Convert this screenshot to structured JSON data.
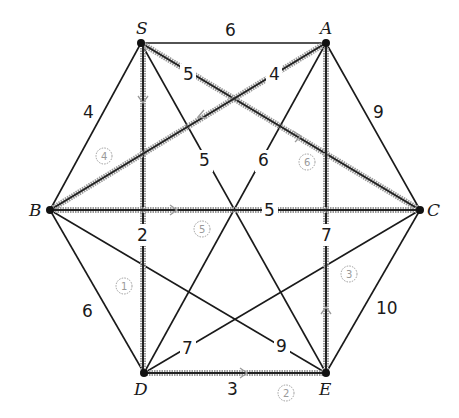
{
  "diagram": {
    "type": "weighted-graph-minimum-spanning-tree",
    "nodes": [
      {
        "id": "S",
        "label": "S",
        "x": 141,
        "y": 43
      },
      {
        "id": "A",
        "label": "A",
        "x": 326,
        "y": 43
      },
      {
        "id": "B",
        "label": "B",
        "x": 50,
        "y": 210
      },
      {
        "id": "C",
        "label": "C",
        "x": 420,
        "y": 210
      },
      {
        "id": "D",
        "label": "D",
        "x": 144,
        "y": 373
      },
      {
        "id": "E",
        "label": "E",
        "x": 326,
        "y": 373
      }
    ],
    "edges": [
      {
        "from": "S",
        "to": "A",
        "weight": "6",
        "highlighted": false
      },
      {
        "from": "S",
        "to": "B",
        "weight": "4",
        "highlighted": false
      },
      {
        "from": "S",
        "to": "C",
        "weight": "5",
        "highlighted": true,
        "order": "6",
        "direction": "S→C"
      },
      {
        "from": "S",
        "to": "D",
        "weight": "2",
        "highlighted": true,
        "order": "1",
        "direction": "S→D"
      },
      {
        "from": "S",
        "to": "E",
        "weight": "5",
        "highlighted": false
      },
      {
        "from": "A",
        "to": "B",
        "weight": "4",
        "highlighted": true,
        "order": "4",
        "direction": "A→B"
      },
      {
        "from": "A",
        "to": "C",
        "weight": "9",
        "highlighted": false
      },
      {
        "from": "A",
        "to": "D",
        "weight": "6",
        "highlighted": false
      },
      {
        "from": "A",
        "to": "E",
        "weight": "7",
        "highlighted": true,
        "order": "3",
        "direction": "E→A"
      },
      {
        "from": "B",
        "to": "C",
        "weight": "5",
        "highlighted": true,
        "order": "5",
        "direction": "B→C"
      },
      {
        "from": "B",
        "to": "D",
        "weight": "6",
        "highlighted": false
      },
      {
        "from": "B",
        "to": "E",
        "weight": "9",
        "highlighted": false
      },
      {
        "from": "C",
        "to": "D",
        "weight": "7",
        "highlighted": false
      },
      {
        "from": "C",
        "to": "E",
        "weight": "10",
        "highlighted": false
      },
      {
        "from": "D",
        "to": "E",
        "weight": "3",
        "highlighted": true,
        "order": "2",
        "direction": "D→E"
      }
    ],
    "labels": {
      "S": "S",
      "A": "A",
      "B": "B",
      "C": "C",
      "D": "D",
      "E": "E",
      "w_SA": "6",
      "w_SB": "4",
      "w_SC": "5",
      "w_SD": "2",
      "w_SE": "5",
      "w_AB": "4",
      "w_AC": "9",
      "w_AD": "6",
      "w_AE": "7",
      "w_BC": "5",
      "w_BD": "6",
      "w_BE": "9",
      "w_CD": "7",
      "w_CE": "10",
      "w_DE": "3",
      "o1": "1",
      "o2": "2",
      "o3": "3",
      "o4": "4",
      "o5": "5",
      "o6": "6"
    }
  }
}
